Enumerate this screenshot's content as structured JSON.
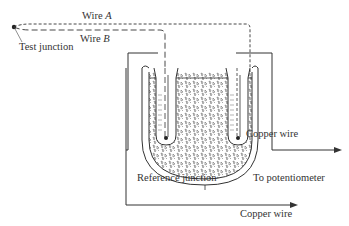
{
  "diagram": {
    "type": "thermocouple-reference-junction",
    "labels": {
      "wire_a_prefix": "Wire",
      "wire_a_letter": "A",
      "wire_b_prefix": "Wire",
      "wire_b_letter": "B",
      "test_junction": "Test junction",
      "reference_junction": "Reference junction",
      "copper_wire_top": "Copper wire",
      "to_potentiometer": "To potentiometer",
      "copper_wire_bottom": "Copper wire"
    },
    "colors": {
      "line": "#333333",
      "background": "#ffffff"
    }
  }
}
